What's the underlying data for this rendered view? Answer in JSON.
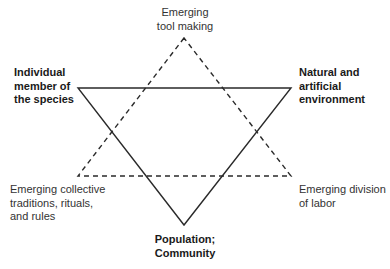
{
  "diagram": {
    "solid_triangle": {
      "style": "solid",
      "color": "#2a2a2a",
      "vertices": [
        {
          "id": "individual",
          "label_lines": [
            "Individual",
            "member of",
            "the species"
          ]
        },
        {
          "id": "environment",
          "label_lines": [
            "Natural and",
            "artificial",
            "environment"
          ]
        },
        {
          "id": "population",
          "label_lines": [
            "Population;",
            "Community"
          ]
        }
      ]
    },
    "dashed_triangle": {
      "style": "dashed",
      "color": "#2a2a2a",
      "vertices": [
        {
          "id": "tool_making",
          "label_lines": [
            "Emerging",
            "tool making"
          ]
        },
        {
          "id": "traditions",
          "label_lines": [
            "Emerging collective",
            "traditions, rituals,",
            "and rules"
          ]
        },
        {
          "id": "division_of_labor",
          "label_lines": [
            "Emerging division",
            "of labor"
          ]
        }
      ]
    }
  }
}
